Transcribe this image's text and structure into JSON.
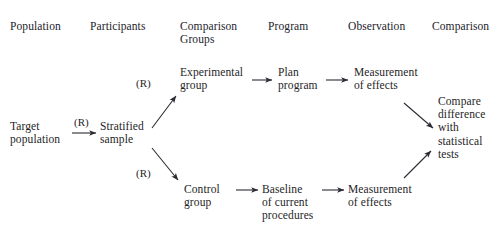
{
  "diagram": {
    "stroke_color": "#2b2b33",
    "text_color": "#1e1e26",
    "background": "#ffffff",
    "headers": [
      {
        "label": "Population"
      },
      {
        "label": "Participants"
      },
      {
        "label": "Comparison\nGroups"
      },
      {
        "label": "Program"
      },
      {
        "label": "Observation"
      },
      {
        "label": "Comparison"
      }
    ],
    "nodes": [
      {
        "id": "target_population",
        "label": "Target\npopulation"
      },
      {
        "id": "stratified_sample",
        "label": "Stratified\nsample"
      },
      {
        "id": "experimental_group",
        "label": "Experimental\ngroup"
      },
      {
        "id": "plan_program",
        "label": "Plan\nprogram"
      },
      {
        "id": "measurement_top",
        "label": "Measurement\nof effects"
      },
      {
        "id": "compare",
        "label": "Compare\ndifference\nwith\nstatistical\ntests"
      },
      {
        "id": "control_group",
        "label": "Control\ngroup"
      },
      {
        "id": "baseline",
        "label": "Baseline\nof current\nprocedures"
      },
      {
        "id": "measurement_bottom",
        "label": "Measurement\nof effects"
      }
    ],
    "edge_labels": [
      {
        "id": "randomize_sample",
        "label": "(R)"
      },
      {
        "id": "randomize_experimental",
        "label": "(R)"
      },
      {
        "id": "randomize_control",
        "label": "(R)"
      }
    ],
    "edges": [
      {
        "from": "target_population",
        "to": "stratified_sample",
        "label": "(R)"
      },
      {
        "from": "stratified_sample",
        "to": "experimental_group",
        "label": "(R)"
      },
      {
        "from": "stratified_sample",
        "to": "control_group",
        "label": "(R)"
      },
      {
        "from": "experimental_group",
        "to": "plan_program",
        "label": ""
      },
      {
        "from": "plan_program",
        "to": "measurement_top",
        "label": ""
      },
      {
        "from": "measurement_top",
        "to": "compare",
        "label": ""
      },
      {
        "from": "control_group",
        "to": "baseline",
        "label": ""
      },
      {
        "from": "baseline",
        "to": "measurement_bottom",
        "label": ""
      },
      {
        "from": "measurement_bottom",
        "to": "compare",
        "label": ""
      }
    ]
  }
}
